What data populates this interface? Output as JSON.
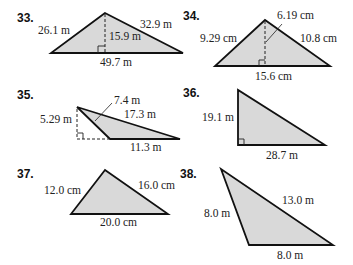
{
  "problems": [
    {
      "number": "33.",
      "labels": {
        "left": "26.1 m",
        "right": "32.9 m",
        "height": "15.9 m",
        "base": "49.7 m"
      }
    },
    {
      "number": "34.",
      "labels": {
        "height": "6.19 cm",
        "left": "9.29 cm",
        "right": "10.8 cm",
        "base": "15.6 cm"
      }
    },
    {
      "number": "35.",
      "labels": {
        "top": "7.4 m",
        "right": "17.3 m",
        "height": "5.29 m",
        "base": "11.3 m"
      }
    },
    {
      "number": "36.",
      "labels": {
        "left": "19.1 m",
        "base": "28.7 m"
      }
    },
    {
      "number": "37.",
      "labels": {
        "left": "12.0 cm",
        "right": "16.0 cm",
        "base": "20.0 cm"
      }
    },
    {
      "number": "38.",
      "labels": {
        "left": "8.0 m",
        "right": "13.0 m",
        "base": "8.0 m"
      }
    }
  ],
  "colors": {
    "fill": "#d9d9d9",
    "stroke": "#111111"
  }
}
